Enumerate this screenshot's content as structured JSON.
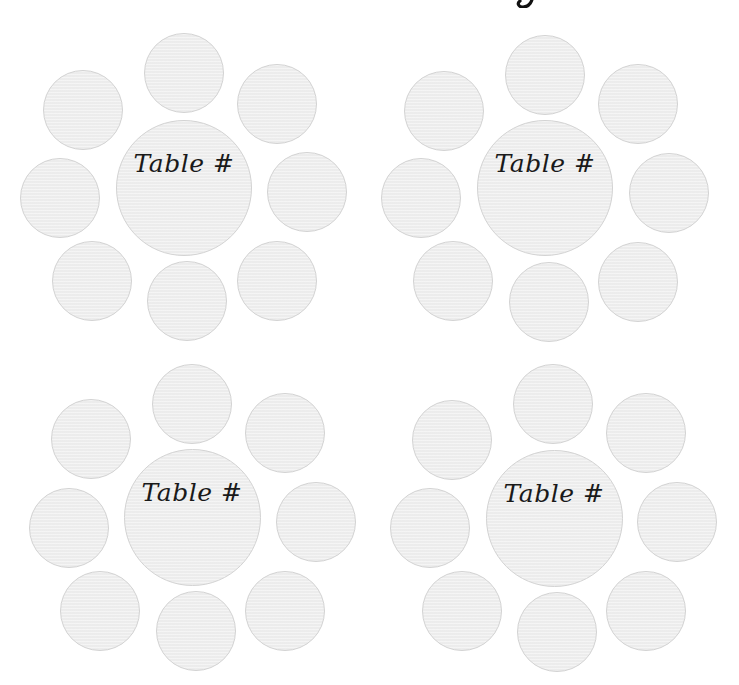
{
  "page": {
    "background": "#ffffff",
    "title_fragment": "g"
  },
  "style": {
    "circle_fill": "#efefef",
    "circle_border": "#d3d3d3",
    "label_color": "#1a1a1a"
  },
  "tables": [
    {
      "label": "Table #",
      "center": {
        "cx": 184,
        "cy": 188,
        "d": 136
      },
      "seats": [
        {
          "position": "top",
          "cx": 184,
          "cy": 73,
          "d": 80
        },
        {
          "position": "top-left",
          "cx": 83,
          "cy": 110,
          "d": 80
        },
        {
          "position": "top-right",
          "cx": 277,
          "cy": 104,
          "d": 80
        },
        {
          "position": "left",
          "cx": 60,
          "cy": 198,
          "d": 80
        },
        {
          "position": "right",
          "cx": 307,
          "cy": 192,
          "d": 80
        },
        {
          "position": "bottom-left",
          "cx": 92,
          "cy": 281,
          "d": 80
        },
        {
          "position": "bottom",
          "cx": 187,
          "cy": 301,
          "d": 80
        },
        {
          "position": "bottom-right",
          "cx": 277,
          "cy": 281,
          "d": 80
        }
      ]
    },
    {
      "label": "Table #",
      "center": {
        "cx": 545,
        "cy": 188,
        "d": 136
      },
      "seats": [
        {
          "position": "top",
          "cx": 545,
          "cy": 75,
          "d": 80
        },
        {
          "position": "top-left",
          "cx": 444,
          "cy": 111,
          "d": 80
        },
        {
          "position": "top-right",
          "cx": 638,
          "cy": 104,
          "d": 80
        },
        {
          "position": "left",
          "cx": 421,
          "cy": 198,
          "d": 80
        },
        {
          "position": "right",
          "cx": 669,
          "cy": 193,
          "d": 80
        },
        {
          "position": "bottom-left",
          "cx": 453,
          "cy": 281,
          "d": 80
        },
        {
          "position": "bottom",
          "cx": 549,
          "cy": 302,
          "d": 80
        },
        {
          "position": "bottom-right",
          "cx": 638,
          "cy": 282,
          "d": 80
        }
      ]
    },
    {
      "label": "Table #",
      "center": {
        "cx": 192,
        "cy": 517,
        "d": 137
      },
      "seats": [
        {
          "position": "top",
          "cx": 192,
          "cy": 404,
          "d": 80
        },
        {
          "position": "top-left",
          "cx": 91,
          "cy": 439,
          "d": 80
        },
        {
          "position": "top-right",
          "cx": 285,
          "cy": 433,
          "d": 80
        },
        {
          "position": "left",
          "cx": 69,
          "cy": 528,
          "d": 80
        },
        {
          "position": "right",
          "cx": 316,
          "cy": 522,
          "d": 80
        },
        {
          "position": "bottom-left",
          "cx": 100,
          "cy": 611,
          "d": 80
        },
        {
          "position": "bottom",
          "cx": 196,
          "cy": 631,
          "d": 80
        },
        {
          "position": "bottom-right",
          "cx": 285,
          "cy": 611,
          "d": 80
        }
      ]
    },
    {
      "label": "Table #",
      "center": {
        "cx": 554,
        "cy": 518,
        "d": 137
      },
      "seats": [
        {
          "position": "top",
          "cx": 553,
          "cy": 404,
          "d": 80
        },
        {
          "position": "top-left",
          "cx": 452,
          "cy": 440,
          "d": 80
        },
        {
          "position": "top-right",
          "cx": 646,
          "cy": 433,
          "d": 80
        },
        {
          "position": "left",
          "cx": 430,
          "cy": 528,
          "d": 80
        },
        {
          "position": "right",
          "cx": 677,
          "cy": 522,
          "d": 80
        },
        {
          "position": "bottom-left",
          "cx": 462,
          "cy": 611,
          "d": 80
        },
        {
          "position": "bottom",
          "cx": 557,
          "cy": 632,
          "d": 80
        },
        {
          "position": "bottom-right",
          "cx": 646,
          "cy": 611,
          "d": 80
        }
      ]
    }
  ]
}
